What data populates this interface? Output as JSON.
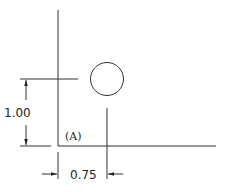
{
  "drawing": {
    "type": "dimensioned-hole-location",
    "hole": {
      "shape": "circle"
    },
    "datum_label": "(A)",
    "dimensions": {
      "vertical": {
        "value": "1.00"
      },
      "horizontal": {
        "value": "0.75"
      }
    }
  },
  "colors": {
    "line": "#333333",
    "text": "#222222",
    "background": "#ffffff"
  }
}
